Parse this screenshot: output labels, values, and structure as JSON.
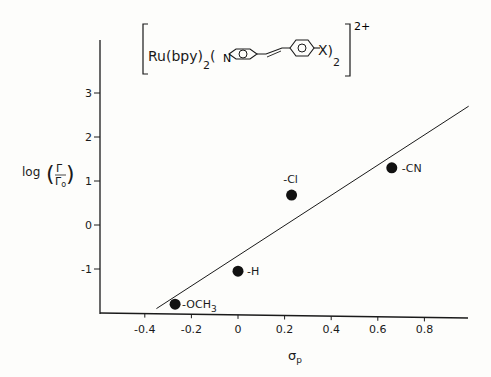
{
  "chart_data": {
    "type": "scatter",
    "formula": {
      "prefix": "Ru(bpy)",
      "prefix_sub": "2",
      "ligand_open": "(",
      "pyridine_N": "N",
      "substituent": "X",
      "ligand_close": ")",
      "ligand_sub": "2",
      "charge": "2+"
    },
    "xlabel": "σ",
    "xlabel_sub": "p",
    "ylabel": "log",
    "ylabel_frac_num": "Γ",
    "ylabel_frac_den": "Γ",
    "ylabel_frac_den_sub": "o",
    "xlim": [
      -0.55,
      1.0
    ],
    "ylim": [
      -2.0,
      4.0
    ],
    "x_ticks": [
      -0.4,
      -0.2,
      0,
      0.2,
      0.4,
      0.6,
      0.8
    ],
    "x_tick_labels": [
      "-0.4",
      "-0.2",
      "0",
      "0.2",
      "0.4",
      "0.6",
      "0.8"
    ],
    "y_ticks": [
      3,
      2,
      1,
      0,
      -1
    ],
    "y_tick_labels": [
      "3",
      "2",
      "1",
      "0",
      "-1"
    ],
    "grid": false,
    "legend": null,
    "series": [
      {
        "name": "substituents",
        "points": [
          {
            "label": "-OCH",
            "label_sub": "3",
            "x": -0.27,
            "y": -1.8
          },
          {
            "label": "-H",
            "label_sub": "",
            "x": 0.0,
            "y": -1.05
          },
          {
            "label": "-Cl",
            "label_sub": "",
            "x": 0.23,
            "y": 0.68
          },
          {
            "label": "-CN",
            "label_sub": "",
            "x": 0.66,
            "y": 1.3
          }
        ]
      }
    ],
    "fit_line": {
      "x_start": -0.35,
      "y_start": -1.9,
      "x_end": 0.99,
      "y_end": 2.7
    }
  }
}
